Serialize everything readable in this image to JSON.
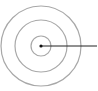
{
  "diagram": {
    "type": "concentric-circles-with-radius-line",
    "center": {
      "x": 41,
      "y": 46
    },
    "rings": [
      {
        "name": "outer-ring",
        "r": 40,
        "color": "#a8a8a8"
      },
      {
        "name": "middle-ring",
        "r": 26,
        "color": "#a8a8a8"
      },
      {
        "name": "inner-ring",
        "r": 10,
        "color": "#a8a8a8"
      }
    ],
    "center_dot": {
      "r": 1.6,
      "color": "#111111"
    },
    "radius_line": {
      "x1": 41,
      "y1": 46,
      "x2": 97,
      "y2": 46,
      "color": "#222222"
    }
  }
}
